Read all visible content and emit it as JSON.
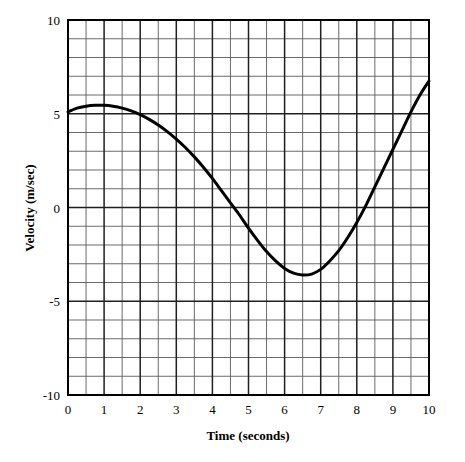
{
  "chart_data": {
    "type": "line",
    "title": "",
    "xlabel": "Time (seconds)",
    "ylabel": "Velocity (m/sec)",
    "xlim": [
      0,
      10
    ],
    "ylim": [
      -10,
      10
    ],
    "grid": true,
    "grid_major_x_step": 1,
    "grid_minor_x_step": 0.5,
    "grid_major_y_step": 5,
    "grid_minor_y_step": 1,
    "legend": "none",
    "xticks": [
      "0",
      "1",
      "2",
      "3",
      "4",
      "5",
      "6",
      "7",
      "8",
      "9",
      "10"
    ],
    "xtick_values": [
      0,
      1,
      2,
      3,
      4,
      5,
      6,
      7,
      8,
      9,
      10
    ],
    "yticks": [
      "10",
      "5",
      "0",
      "-5",
      "-10"
    ],
    "ytick_values": [
      10,
      5,
      0,
      -5,
      -10
    ],
    "series": [
      {
        "name": "velocity",
        "x": [
          0.0,
          0.25,
          0.5,
          0.75,
          1.0,
          1.25,
          1.5,
          1.75,
          2.0,
          2.25,
          2.5,
          2.75,
          3.0,
          3.25,
          3.5,
          3.75,
          4.0,
          4.25,
          4.5,
          4.75,
          5.0,
          5.25,
          5.5,
          5.75,
          6.0,
          6.25,
          6.5,
          6.75,
          7.0,
          7.25,
          7.5,
          7.75,
          8.0,
          8.25,
          8.5,
          8.75,
          9.0,
          9.25,
          9.5,
          9.75,
          10.0
        ],
        "values": [
          5.1,
          5.3,
          5.4,
          5.45,
          5.45,
          5.4,
          5.3,
          5.15,
          4.95,
          4.7,
          4.4,
          4.05,
          3.65,
          3.2,
          2.7,
          2.15,
          1.55,
          0.9,
          0.25,
          -0.4,
          -1.1,
          -1.75,
          -2.35,
          -2.85,
          -3.25,
          -3.5,
          -3.6,
          -3.55,
          -3.3,
          -2.85,
          -2.3,
          -1.6,
          -0.8,
          0.1,
          1.1,
          2.1,
          3.1,
          4.1,
          5.1,
          6.0,
          6.75
        ]
      }
    ],
    "annotations": {
      "initial_value": 5.1,
      "max_value": 5.45,
      "max_at_time": 0.85,
      "min_value": -3.6,
      "min_at_time": 6.4,
      "first_zero_crossing": 4.1,
      "second_zero_crossing": 8.0,
      "final_value": 6.75
    }
  },
  "axes": {
    "x_title": "Time (seconds)",
    "y_title": "Velocity (m/sec)"
  }
}
